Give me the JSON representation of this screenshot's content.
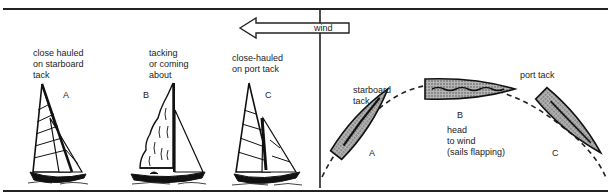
{
  "wind_label": "wind",
  "left_panel": {
    "boats": [
      {
        "letter": "A",
        "caption": "close hauled\non starboard\ntack"
      },
      {
        "letter": "B",
        "caption": "tacking\nor coming\nabout"
      },
      {
        "letter": "C",
        "caption": "close-hauled\non port tack"
      }
    ]
  },
  "right_panel": {
    "labels": {
      "starboard": "starboard\ntack",
      "port": "port tack",
      "head": "head\nto wind\n(sails flapping)"
    },
    "boats": [
      {
        "letter": "A"
      },
      {
        "letter": "B"
      },
      {
        "letter": "C"
      }
    ]
  },
  "colors": {
    "ink": "#111111",
    "hull_fill": "#8a8a8a",
    "background": "#ffffff"
  }
}
